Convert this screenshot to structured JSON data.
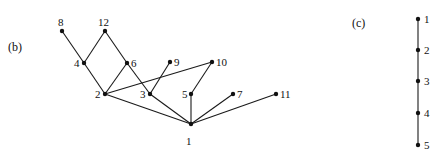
{
  "panels": [
    {
      "id": "b",
      "label": "(b)",
      "label_pos": [
        8,
        41
      ],
      "nodes": [
        {
          "id": "1",
          "label": "1",
          "x": 191,
          "y": 124,
          "lx": 186,
          "ly": 136
        },
        {
          "id": "2",
          "label": "2",
          "x": 105,
          "y": 94,
          "lx": 95,
          "ly": 89
        },
        {
          "id": "3",
          "label": "3",
          "x": 150,
          "y": 94,
          "lx": 140,
          "ly": 89
        },
        {
          "id": "4",
          "label": "4",
          "x": 84,
          "y": 63,
          "lx": 74,
          "ly": 58
        },
        {
          "id": "5",
          "label": "5",
          "x": 191,
          "y": 94,
          "lx": 182,
          "ly": 89
        },
        {
          "id": "6",
          "label": "6",
          "x": 127,
          "y": 63,
          "lx": 131,
          "ly": 58
        },
        {
          "id": "7",
          "label": "7",
          "x": 233,
          "y": 94,
          "lx": 237,
          "ly": 89
        },
        {
          "id": "8",
          "label": "8",
          "x": 62,
          "y": 31,
          "lx": 58,
          "ly": 17
        },
        {
          "id": "9",
          "label": "9",
          "x": 170,
          "y": 62,
          "lx": 174,
          "ly": 57
        },
        {
          "id": "10",
          "label": "10",
          "x": 212,
          "y": 62,
          "lx": 216,
          "ly": 57
        },
        {
          "id": "11",
          "label": "11",
          "x": 276,
          "y": 94,
          "lx": 280,
          "ly": 89
        },
        {
          "id": "12",
          "label": "12",
          "x": 105,
          "y": 31,
          "lx": 98,
          "ly": 17
        }
      ],
      "edges": [
        [
          "8",
          "4"
        ],
        [
          "12",
          "4"
        ],
        [
          "12",
          "6"
        ],
        [
          "4",
          "2"
        ],
        [
          "6",
          "2"
        ],
        [
          "6",
          "3"
        ],
        [
          "2",
          "10"
        ],
        [
          "9",
          "3"
        ],
        [
          "10",
          "5"
        ],
        [
          "2",
          "1"
        ],
        [
          "3",
          "1"
        ],
        [
          "5",
          "1"
        ],
        [
          "7",
          "1"
        ],
        [
          "11",
          "1"
        ]
      ]
    },
    {
      "id": "c",
      "label": "(c)",
      "label_pos": [
        352,
        17
      ],
      "nodes": [
        {
          "id": "1",
          "label": "1",
          "x": 418,
          "y": 19,
          "lx": 424,
          "ly": 14
        },
        {
          "id": "2",
          "label": "2",
          "x": 418,
          "y": 50,
          "lx": 424,
          "ly": 45
        },
        {
          "id": "3",
          "label": "3",
          "x": 418,
          "y": 81,
          "lx": 424,
          "ly": 76
        },
        {
          "id": "4",
          "label": "4",
          "x": 418,
          "y": 113,
          "lx": 424,
          "ly": 108
        },
        {
          "id": "5",
          "label": "5",
          "x": 418,
          "y": 145,
          "lx": 424,
          "ly": 140
        }
      ],
      "edges": [
        [
          "1",
          "2"
        ],
        [
          "2",
          "3"
        ],
        [
          "3",
          "4"
        ],
        [
          "4",
          "5"
        ]
      ]
    }
  ],
  "style": {
    "line_color": "#1a1a1a",
    "node_color": "#111111",
    "node_radius": 2.2
  }
}
